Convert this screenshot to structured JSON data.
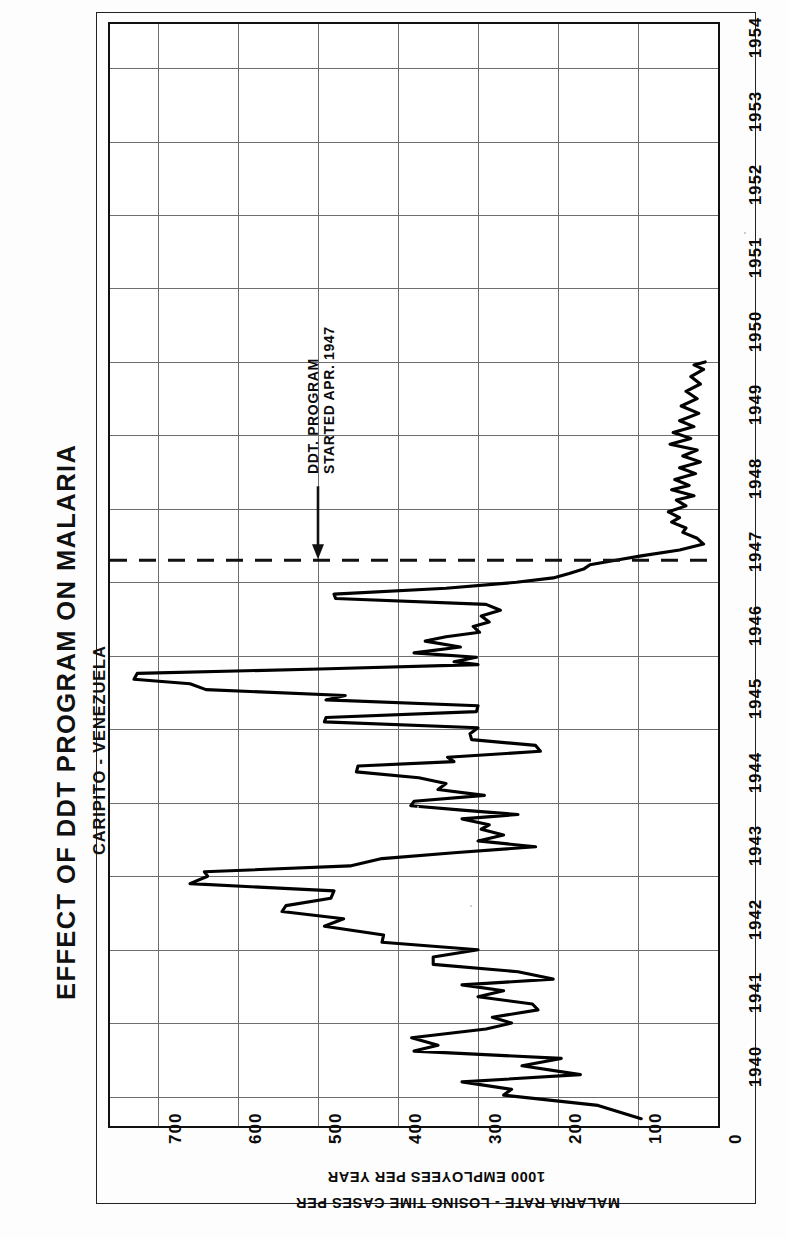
{
  "titles": {
    "main": "EFFECT OF DDT PROGRAM ON MALARIA",
    "sub1": "CARIPITO - VENEZUELA",
    "sub2": "CREOLE PETROLEUM CORP. MEDICAL DEPT."
  },
  "annotation": {
    "line1": "DDT. PROGRAM",
    "line2": "STARTED APR. 1947",
    "arrow": "down-arrow-icon",
    "marker_year": 1947.3
  },
  "axis_caption": {
    "line1": "MALARIA RATE - LOSING TIME CASES PER",
    "line2": "1000 EMPLOYEES PER YEAR"
  },
  "chart_data": {
    "type": "line",
    "orientation": "rotated-90",
    "title": "EFFECT OF DDT PROGRAM ON MALARIA",
    "subtitle": "CARIPITO - VENEZUELA / CREOLE PETROLEUM CORP. MEDICAL DEPT.",
    "xlabel": "",
    "ylabel": "MALARIA RATE - LOSING TIME CASES PER 1000 EMPLOYEES PER YEAR",
    "xlim": [
      1939.6,
      1954.6
    ],
    "ylim": [
      0,
      760
    ],
    "grid": true,
    "legend": "none",
    "x_ticks": [
      1940,
      1941,
      1942,
      1943,
      1944,
      1945,
      1946,
      1947,
      1948,
      1949,
      1950,
      1951,
      1952,
      1953,
      1954
    ],
    "y_ticks": [
      0,
      100,
      200,
      300,
      400,
      500,
      600,
      700
    ],
    "annotations": [
      {
        "text": "DDT. PROGRAM STARTED APR. 1947",
        "x": 1947.3,
        "style": "dashed-line-with-arrow"
      }
    ],
    "series": [
      {
        "name": "Malaria rate",
        "color": "#000000",
        "points": [
          [
            1939.7,
            96
          ],
          [
            1939.88,
            150
          ],
          [
            1940.02,
            268
          ],
          [
            1940.1,
            258
          ],
          [
            1940.2,
            320
          ],
          [
            1940.3,
            172
          ],
          [
            1940.42,
            245
          ],
          [
            1940.52,
            196
          ],
          [
            1940.62,
            380
          ],
          [
            1940.7,
            350
          ],
          [
            1940.8,
            383
          ],
          [
            1940.92,
            290
          ],
          [
            1941.0,
            258
          ],
          [
            1941.08,
            282
          ],
          [
            1941.18,
            225
          ],
          [
            1941.26,
            232
          ],
          [
            1941.36,
            300
          ],
          [
            1941.44,
            268
          ],
          [
            1941.52,
            320
          ],
          [
            1941.6,
            206
          ],
          [
            1941.7,
            250
          ],
          [
            1941.8,
            356
          ],
          [
            1941.9,
            356
          ],
          [
            1942.0,
            300
          ],
          [
            1942.1,
            420
          ],
          [
            1942.2,
            418
          ],
          [
            1942.32,
            492
          ],
          [
            1942.42,
            468
          ],
          [
            1942.52,
            545
          ],
          [
            1942.6,
            540
          ],
          [
            1942.7,
            484
          ],
          [
            1942.8,
            480
          ],
          [
            1942.9,
            660
          ],
          [
            1943.0,
            638
          ],
          [
            1943.06,
            642
          ],
          [
            1943.14,
            460
          ],
          [
            1943.24,
            420
          ],
          [
            1943.32,
            330
          ],
          [
            1943.4,
            228
          ],
          [
            1943.48,
            300
          ],
          [
            1943.56,
            268
          ],
          [
            1943.64,
            296
          ],
          [
            1943.7,
            286
          ],
          [
            1943.78,
            320
          ],
          [
            1943.84,
            250
          ],
          [
            1943.9,
            320
          ],
          [
            1943.96,
            384
          ],
          [
            1944.02,
            380
          ],
          [
            1944.1,
            292
          ],
          [
            1944.18,
            350
          ],
          [
            1944.26,
            340
          ],
          [
            1944.34,
            374
          ],
          [
            1944.42,
            452
          ],
          [
            1944.5,
            450
          ],
          [
            1944.56,
            330
          ],
          [
            1944.62,
            338
          ],
          [
            1944.7,
            222
          ],
          [
            1944.78,
            228
          ],
          [
            1944.86,
            308
          ],
          [
            1944.94,
            310
          ],
          [
            1945.02,
            300
          ],
          [
            1945.1,
            492
          ],
          [
            1945.16,
            490
          ],
          [
            1945.24,
            302
          ],
          [
            1945.32,
            300
          ],
          [
            1945.4,
            490
          ],
          [
            1945.46,
            466
          ],
          [
            1945.54,
            640
          ],
          [
            1945.62,
            660
          ],
          [
            1945.68,
            730
          ],
          [
            1945.76,
            726
          ],
          [
            1945.82,
            498
          ],
          [
            1945.88,
            300
          ],
          [
            1945.92,
            330
          ],
          [
            1945.98,
            302
          ],
          [
            1946.04,
            380
          ],
          [
            1946.12,
            322
          ],
          [
            1946.2,
            366
          ],
          [
            1946.26,
            340
          ],
          [
            1946.32,
            298
          ],
          [
            1946.4,
            306
          ],
          [
            1946.46,
            286
          ],
          [
            1946.54,
            296
          ],
          [
            1946.62,
            272
          ],
          [
            1946.7,
            290
          ],
          [
            1946.78,
            478
          ],
          [
            1946.84,
            480
          ],
          [
            1946.92,
            340
          ],
          [
            1947.0,
            252
          ],
          [
            1947.06,
            206
          ],
          [
            1947.12,
            186
          ],
          [
            1947.18,
            168
          ],
          [
            1947.24,
            160
          ],
          [
            1947.3,
            128
          ],
          [
            1947.36,
            96
          ],
          [
            1947.44,
            48
          ],
          [
            1947.52,
            18
          ],
          [
            1947.6,
            26
          ],
          [
            1947.68,
            44
          ],
          [
            1947.74,
            40
          ],
          [
            1947.82,
            58
          ],
          [
            1947.88,
            48
          ],
          [
            1947.96,
            62
          ],
          [
            1948.04,
            40
          ],
          [
            1948.12,
            52
          ],
          [
            1948.18,
            30
          ],
          [
            1948.26,
            58
          ],
          [
            1948.32,
            36
          ],
          [
            1948.4,
            54
          ],
          [
            1948.48,
            28
          ],
          [
            1948.56,
            48
          ],
          [
            1948.64,
            22
          ],
          [
            1948.72,
            44
          ],
          [
            1948.8,
            26
          ],
          [
            1948.88,
            60
          ],
          [
            1948.96,
            34
          ],
          [
            1949.04,
            56
          ],
          [
            1949.12,
            30
          ],
          [
            1949.2,
            48
          ],
          [
            1949.3,
            24
          ],
          [
            1949.4,
            46
          ],
          [
            1949.5,
            26
          ],
          [
            1949.6,
            40
          ],
          [
            1949.7,
            22
          ],
          [
            1949.8,
            34
          ],
          [
            1949.9,
            18
          ],
          [
            1949.96,
            30
          ],
          [
            1950.0,
            16
          ]
        ]
      }
    ]
  }
}
